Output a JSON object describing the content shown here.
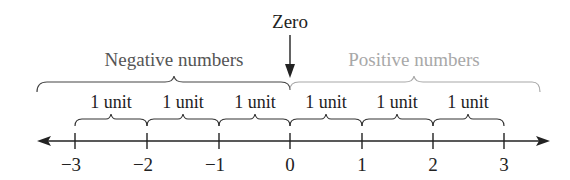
{
  "zero_label": "Zero",
  "negative_label": "Negative numbers",
  "positive_label": "Positive numbers",
  "unit_label": "1 unit",
  "ticks": [
    "−3",
    "−2",
    "−1",
    "0",
    "1",
    "2",
    "3"
  ],
  "colors": {
    "primary": "#222222",
    "positive": "#a8a8a8"
  }
}
